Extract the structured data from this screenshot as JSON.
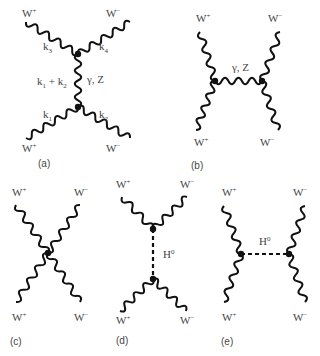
{
  "figure": {
    "panels": [
      {
        "id": "a",
        "caption": "(a)",
        "type": "s-channel",
        "vertices": [
          [
            78,
            54
          ],
          [
            78,
            107
          ]
        ],
        "external": [
          {
            "label": "W",
            "charge": "+",
            "from": [
              26,
              22
            ],
            "to": [
              78,
              54
            ],
            "momentum": "k",
            "momentum_index": "3"
          },
          {
            "label": "W",
            "charge": "−",
            "from": [
              130,
              22
            ],
            "to": [
              78,
              54
            ],
            "momentum": "k",
            "momentum_index": "4"
          },
          {
            "label": "W",
            "charge": "+",
            "from": [
              26,
              138
            ],
            "to": [
              78,
              107
            ],
            "momentum": "k",
            "momentum_index": "1"
          },
          {
            "label": "W",
            "charge": "−",
            "from": [
              130,
              138
            ],
            "to": [
              78,
              107
            ],
            "momentum": "k",
            "momentum_index": "2"
          }
        ],
        "propagator": {
          "kind": "wavy",
          "label": "γ, Z",
          "momentum": "k1 + k2"
        }
      },
      {
        "id": "b",
        "caption": "(b)",
        "type": "t-channel",
        "vertices": [
          [
            215,
            81
          ],
          [
            262,
            81
          ]
        ],
        "external": [
          {
            "label": "W",
            "charge": "+",
            "from": [
              200,
              32
            ],
            "to": [
              215,
              81
            ]
          },
          {
            "label": "W",
            "charge": "−",
            "from": [
              280,
              32
            ],
            "to": [
              262,
              81
            ]
          },
          {
            "label": "W",
            "charge": "+",
            "from": [
              196,
              130
            ],
            "to": [
              215,
              81
            ]
          },
          {
            "label": "W",
            "charge": "−",
            "from": [
              278,
              130
            ],
            "to": [
              262,
              81
            ]
          }
        ],
        "propagator": {
          "kind": "wavy",
          "label": "γ, Z"
        }
      },
      {
        "id": "c",
        "caption": "(c)",
        "type": "contact",
        "vertices": [
          [
            48,
            253
          ]
        ],
        "external": [
          {
            "label": "W",
            "charge": "+",
            "from": [
              16,
              205
            ],
            "to": [
              48,
              253
            ]
          },
          {
            "label": "W",
            "charge": "−",
            "from": [
              80,
              205
            ],
            "to": [
              48,
              253
            ]
          },
          {
            "label": "W",
            "charge": "+",
            "from": [
              16,
              302
            ],
            "to": [
              48,
              253
            ]
          },
          {
            "label": "W",
            "charge": "−",
            "from": [
              80,
              302
            ],
            "to": [
              48,
              253
            ]
          }
        ]
      },
      {
        "id": "d",
        "caption": "(d)",
        "type": "s-channel",
        "vertices": [
          [
            153,
            229
          ],
          [
            153,
            279
          ]
        ],
        "external": [
          {
            "label": "W",
            "charge": "+",
            "from": [
              122,
              197
            ],
            "to": [
              153,
              229
            ]
          },
          {
            "label": "W",
            "charge": "−",
            "from": [
              187,
              197
            ],
            "to": [
              153,
              229
            ]
          },
          {
            "label": "W",
            "charge": "+",
            "from": [
              120,
              311
            ],
            "to": [
              153,
              279
            ]
          },
          {
            "label": "W",
            "charge": "−",
            "from": [
              186,
              311
            ],
            "to": [
              153,
              279
            ]
          }
        ],
        "propagator": {
          "kind": "dashed",
          "label": "H",
          "label_sup": "0"
        }
      },
      {
        "id": "e",
        "caption": "(e)",
        "type": "t-channel",
        "vertices": [
          [
            241,
            254
          ],
          [
            289,
            254
          ]
        ],
        "external": [
          {
            "label": "W",
            "charge": "+",
            "from": [
              224,
              206
            ],
            "to": [
              241,
              254
            ]
          },
          {
            "label": "W",
            "charge": "−",
            "from": [
              305,
              206
            ],
            "to": [
              289,
              254
            ]
          },
          {
            "label": "W",
            "charge": "+",
            "from": [
              224,
              302
            ],
            "to": [
              241,
              254
            ]
          },
          {
            "label": "W",
            "charge": "−",
            "from": [
              305,
              302
            ],
            "to": [
              289,
              254
            ]
          }
        ],
        "propagator": {
          "kind": "dashed",
          "label": "H",
          "label_sup": "0"
        }
      }
    ]
  },
  "labels": {
    "W": "W",
    "plus": "+",
    "minus": "−",
    "k": "k",
    "gammaZ": "γ, Z",
    "H": "H",
    "zero": "0",
    "k1k2_plus": " + ",
    "one": "1",
    "two": "2",
    "three": "3",
    "four": "4",
    "cap_a": "(a)",
    "cap_b": "(b)",
    "cap_c": "(c)",
    "cap_d": "(d)",
    "cap_e": "(e)"
  }
}
